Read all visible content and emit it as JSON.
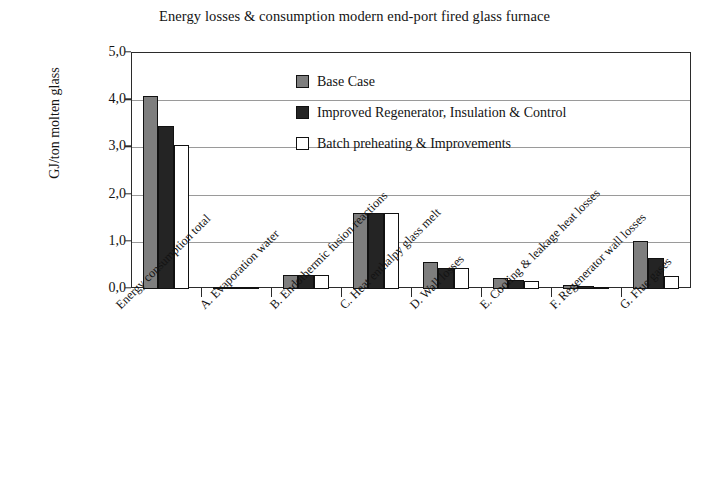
{
  "chart_data": {
    "type": "bar",
    "title": "Energy losses & consumption modern end-port fired glass furnace",
    "xlabel": "",
    "ylabel": "GJ/ton molten glass",
    "ylim": [
      0.0,
      5.0
    ],
    "ytick_labels": [
      "0,0",
      "1,0",
      "2,0",
      "3,0",
      "4,0",
      "5,0"
    ],
    "ytick_values": [
      0.0,
      1.0,
      2.0,
      3.0,
      4.0,
      5.0
    ],
    "grid": true,
    "legend_position": "upper-center-inside",
    "categories": [
      "Energy consumption total",
      "A. Evaporation water",
      "B. Endothermic fusion reactions",
      "C. Heat enthalpy glass melt",
      "D. Wall losses",
      "E. Cooling & leakage heat losses",
      "F. Regenerator wall losses",
      "G. Flue gases"
    ],
    "series": [
      {
        "name": "Base Case",
        "color": "#7e7e7e",
        "values": [
          4.08,
          0.05,
          0.29,
          1.62,
          0.58,
          0.23,
          0.08,
          1.02
        ]
      },
      {
        "name": "Improved Regenerator, Insulation & Control",
        "color": "#242424",
        "values": [
          3.46,
          0.05,
          0.29,
          1.62,
          0.45,
          0.2,
          0.06,
          0.65
        ]
      },
      {
        "name": "Batch preheating & Improvements",
        "color": "#ffffff",
        "values": [
          3.06,
          0.03,
          0.29,
          1.62,
          0.45,
          0.17,
          0.05,
          0.28
        ]
      }
    ]
  },
  "axis": {
    "y_title": "GJ/ton molten glass"
  }
}
